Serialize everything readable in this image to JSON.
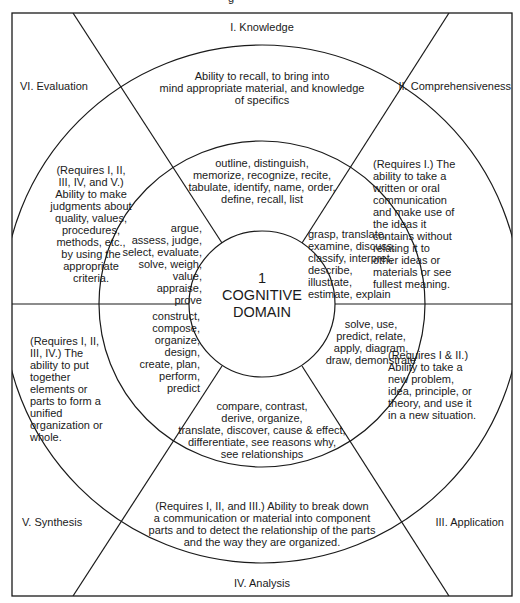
{
  "header_fragment": "g",
  "center": {
    "number": "1",
    "title": "COGNITIVE\nDOMAIN"
  },
  "levels": {
    "knowledge": {
      "label": "I. Knowledge",
      "description": "Ability to recall, to bring into\nmind appropriate material, and knowledge\nof specifics",
      "verbs": "outline, distinguish,\nmemorize, recognize, recite,\ntabulate, identify, name, order,\ndefine, recall, list"
    },
    "comprehensiveness": {
      "label": "II. Comprehensiveness",
      "description": "(Requires I.) The\nability to take a\nwritten or oral\ncommunication\nand make use of\nthe ideas it\ncontains without\nrelating it to\nother ideas or\nmaterials or see\nfullest meaning.",
      "verbs": "grasp, translate,\nexamine, discuss,\nclassify, interpret,\ndescribe,\nillustrate,\nestimate, explain"
    },
    "application": {
      "label": "III. Application",
      "description": "(Requires I & II.)\nAbility to take a\nnew problem,\nidea, principle, or\ntheory, and use it\nin a new situation.",
      "verbs": "solve, use,\npredict, relate,\napply, diagram,\ndraw, demonstrate"
    },
    "analysis": {
      "label": "IV. Analysis",
      "description": "(Requires I, II, and III.) Ability to break down\na communication or material into component\nparts and to detect the relationship of the parts\nand the way they are organized.",
      "verbs": "compare, contrast,\nderive, organize,\ntranslate, discover, cause & effect,\ndifferentiate, see reasons why,\nsee relationships"
    },
    "synthesis": {
      "label": "V. Synthesis",
      "description": "(Requires I, II,\nIII, IV.) The\nability to put\ntogether\nelements or\nparts to form a\nunified\norganization or\nwhole.",
      "verbs": "construct,\ncompose,\norganize,\ndesign,\ncreate, plan,\nperform,\npredict"
    },
    "evaluation": {
      "label": "VI. Evaluation",
      "description": "(Requires I, II,\nIII, IV, and V.)\nAbility to make\njudgments about\nquality, values,\nprocedures,\nmethods, etc.,\nby using the\nappropriate\ncriteria.",
      "verbs": "argue,\nassess, judge,\nselect, evaluate,\nsolve, weigh,\nvalue,\nappraise,\nprove"
    }
  },
  "colors": {
    "line": "#1a1a1a",
    "background": "#ffffff",
    "text": "#1a1a1a"
  }
}
